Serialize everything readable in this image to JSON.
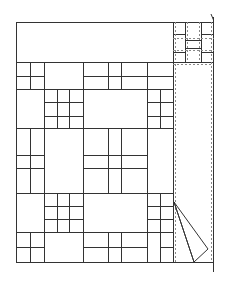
{
  "diagram": {
    "title": "",
    "stroke_color": "#333333",
    "dashed_color": "#888888",
    "background": "#ffffff",
    "frame": {
      "x": 16,
      "y": 22,
      "w": 157,
      "h": 240
    },
    "page_edge": {
      "x": 213,
      "y_top": 17,
      "y_bottom": 272
    },
    "top_band": {
      "x": 16,
      "y": 22,
      "w": 157,
      "h": 40
    },
    "corner_block": {
      "x": 173,
      "y": 22,
      "w": 41,
      "h": 40
    },
    "fold": {
      "points": "174,202 208,249 194,262"
    }
  }
}
